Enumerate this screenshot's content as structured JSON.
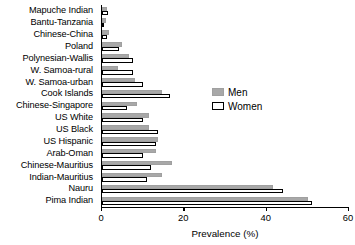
{
  "chart_data": {
    "type": "bar",
    "title": "",
    "xlabel": "Prevalence (%)",
    "ylabel": "",
    "orientation": "horizontal",
    "xlim": [
      0,
      60
    ],
    "xticks": [
      0,
      20,
      40,
      60
    ],
    "xticklabels": [
      "0",
      "20",
      "40",
      "60"
    ],
    "grid": false,
    "legend_position": "center-right",
    "categories": [
      "Mapuche Indian",
      "Bantu-Tanzania",
      "Chinese-China",
      "Poland",
      "Polynesian-Wallis",
      "W. Samoa-rural",
      "W. Samoa-urban",
      "Cook Islands",
      "Chinese-Singapore",
      "US White",
      "US Black",
      "US Hispanic",
      "Arab-Oman",
      "Chinese-Mauritius",
      "Indian-Mauritius",
      "Nauru",
      "Pima Indian"
    ],
    "series": [
      {
        "name": "Men",
        "color": "#a8a8a8",
        "values": [
          1.2,
          1.0,
          1.6,
          4.8,
          6.5,
          4.0,
          8.0,
          14.5,
          8.5,
          11.5,
          11.5,
          13.5,
          13.0,
          17.0,
          14.5,
          41.5,
          50.0
        ]
      },
      {
        "name": "Women",
        "color": "#ffffff",
        "values": [
          1.4,
          0.6,
          1.2,
          4.2,
          7.5,
          7.5,
          10.0,
          16.5,
          6.0,
          10.0,
          13.5,
          13.0,
          10.0,
          12.0,
          11.0,
          44.0,
          51.0
        ]
      }
    ]
  },
  "legend": {
    "entries": [
      {
        "label": "Men"
      },
      {
        "label": "Women"
      }
    ]
  },
  "axis": {
    "x_title": "Prevalence (%)"
  }
}
